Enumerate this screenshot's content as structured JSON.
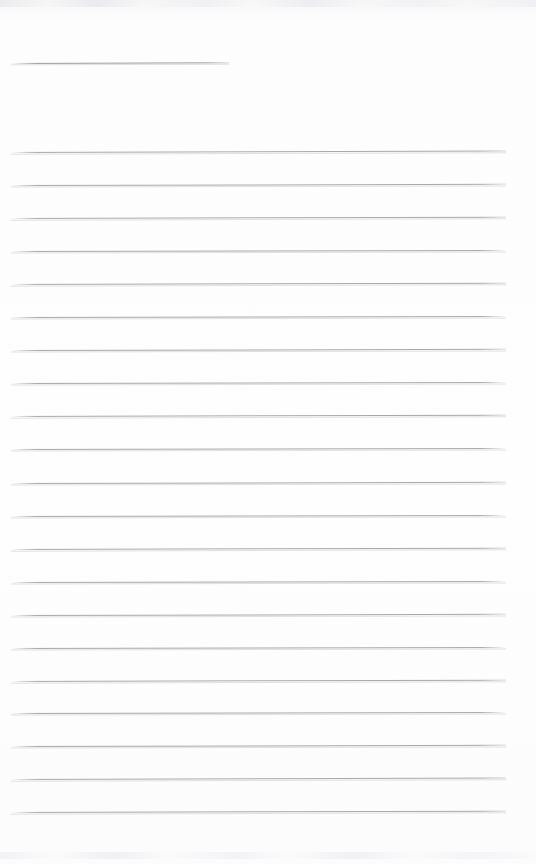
{
  "document": {
    "kind": "scanned-blank-lined-page",
    "page_label": "",
    "body_text": "",
    "background_color": "#fdfdfd",
    "rule_color": "#a9a9ac",
    "title_rule_color": "#9d9da1",
    "page_width": 536,
    "page_height": 864
  },
  "title_rule": {
    "name": "title-underline",
    "x": 11,
    "y": 63,
    "width": 218,
    "tilt_deg": -0.18
  },
  "ruled_lines": {
    "left": 11,
    "right": 506,
    "width": 495,
    "count": 21,
    "spacing": 33,
    "first_y": 152,
    "last_y": 812,
    "items": [
      {
        "y": 152,
        "tilt_deg": -0.16
      },
      {
        "y": 185,
        "tilt_deg": -0.14
      },
      {
        "y": 218,
        "tilt_deg": -0.15
      },
      {
        "y": 251,
        "tilt_deg": -0.13
      },
      {
        "y": 284,
        "tilt_deg": -0.15
      },
      {
        "y": 317,
        "tilt_deg": -0.12
      },
      {
        "y": 350,
        "tilt_deg": -0.14
      },
      {
        "y": 383,
        "tilt_deg": -0.13
      },
      {
        "y": 416,
        "tilt_deg": -0.15
      },
      {
        "y": 449,
        "tilt_deg": -0.12
      },
      {
        "y": 483,
        "tilt_deg": -0.14
      },
      {
        "y": 516,
        "tilt_deg": -0.13
      },
      {
        "y": 549,
        "tilt_deg": -0.15
      },
      {
        "y": 582,
        "tilt_deg": -0.12
      },
      {
        "y": 615,
        "tilt_deg": -0.14
      },
      {
        "y": 648,
        "tilt_deg": -0.13
      },
      {
        "y": 681,
        "tilt_deg": -0.15
      },
      {
        "y": 713,
        "tilt_deg": -0.12
      },
      {
        "y": 746,
        "tilt_deg": -0.14
      },
      {
        "y": 779,
        "tilt_deg": -0.16
      },
      {
        "y": 812,
        "tilt_deg": -0.15
      }
    ]
  }
}
